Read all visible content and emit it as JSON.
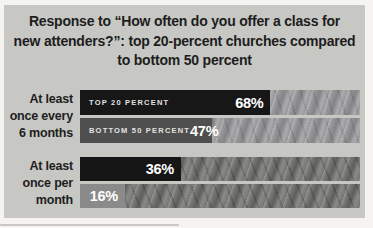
{
  "title": {
    "lines": [
      "Response to “How often do you offer a class for",
      "new attenders?”: top 20-percent churches compared",
      "to bottom 50 percent"
    ]
  },
  "chart_data": {
    "type": "bar",
    "orientation": "horizontal",
    "title": "Response to “How often do you offer a class for new attenders?”: top 20-percent churches compared to bottom 50 percent",
    "categories": [
      "At least once every 6 months",
      "At least once per month"
    ],
    "series": [
      {
        "name": "TOP 20 PERCENT",
        "values": [
          68,
          36
        ],
        "color": "#171717"
      },
      {
        "name": "BOTTOM 50 PERCENT",
        "values": [
          47,
          16
        ],
        "color": "#4f4f4f"
      }
    ],
    "value_suffix": "%",
    "xlim": [
      0,
      100
    ],
    "grid": false,
    "legend_position": "inside-bars",
    "value_labels": [
      "68%",
      "47%",
      "36%",
      "16%"
    ]
  },
  "groups": [
    {
      "label_lines": [
        "At least",
        "once every",
        "6 months"
      ],
      "bars": [
        {
          "series_label": "TOP 20 PERCENT",
          "value": 68,
          "value_label": "68%",
          "fill": "#171717"
        },
        {
          "series_label": "BOTTOM 50 PERCENT",
          "value": 47,
          "value_label": "47%",
          "fill": "#4f4f4f"
        }
      ]
    },
    {
      "label_lines": [
        "At least",
        "once per",
        "month"
      ],
      "bars": [
        {
          "value": 36,
          "value_label": "36%",
          "fill": "#161616"
        },
        {
          "value": 16,
          "value_label": "16%",
          "fill": "#8a8a8a"
        }
      ]
    }
  ],
  "colors": {
    "page_background": "#f5f4f0",
    "panel_background": "#c7c7c4",
    "title_text": "#1d1d1d",
    "top20_bar": "#171717",
    "bottom50_bar_6_months": "#4f4f4f",
    "bottom50_bar_month": "#8a8a8a",
    "bar_text": "#ffffff"
  }
}
